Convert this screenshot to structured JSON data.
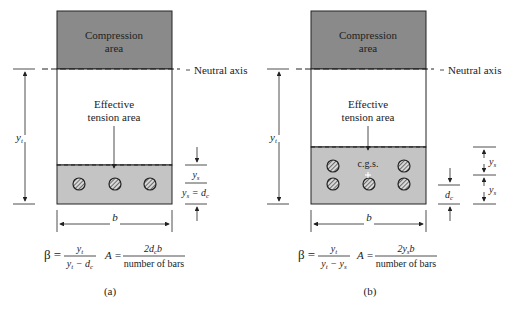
{
  "colors": {
    "compression_fill": "#8a8a8a",
    "tension_fill": "#c4c4c4",
    "line": "#222222",
    "background": "#ffffff"
  },
  "panel_a": {
    "caption": "(a)",
    "compression_label_line1": "Compression",
    "compression_label_line2": "area",
    "neutral_axis_label": "Neutral axis",
    "effective_label_line1": "Effective",
    "effective_label_line2": "tension area",
    "dim_yt": "y",
    "dim_yt_sub": "t",
    "dim_b": "b",
    "dim_ys_top": "y",
    "dim_ys_top_sub": "s",
    "dim_ys_bottom": "y",
    "dim_ys_bottom_sub": "s",
    "dim_ys_eq": " = d",
    "dim_ys_eq_sub": "c",
    "bars": 3,
    "formula_beta_lhs": "β =",
    "formula_beta_num": "y",
    "formula_beta_num_sub": "t",
    "formula_beta_den": "y",
    "formula_beta_den_sub": "t",
    "formula_beta_den_rest": " − d",
    "formula_beta_den_rest_sub": "c",
    "formula_A_lhs": "A =",
    "formula_A_num_pre": "2d",
    "formula_A_num_sub": "c",
    "formula_A_num_post": "b",
    "formula_A_den": "number of bars"
  },
  "panel_b": {
    "caption": "(b)",
    "compression_label_line1": "Compression",
    "compression_label_line2": "area",
    "neutral_axis_label": "Neutral axis",
    "effective_label_line1": "Effective",
    "effective_label_line2": "tension area",
    "cgs_label": "c.g.s.",
    "dim_yt": "y",
    "dim_yt_sub": "t",
    "dim_b": "b",
    "dim_dc": "d",
    "dim_dc_sub": "c",
    "dim_ys1": "y",
    "dim_ys1_sub": "s",
    "dim_ys2": "y",
    "dim_ys2_sub": "s",
    "bars": 6,
    "formula_beta_lhs": "β =",
    "formula_beta_num": "y",
    "formula_beta_num_sub": "t",
    "formula_beta_den": "y",
    "formula_beta_den_sub": "t",
    "formula_beta_den_rest": " − y",
    "formula_beta_den_rest_sub": "s",
    "formula_A_lhs": "A =",
    "formula_A_num_pre": "2y",
    "formula_A_num_sub": "s",
    "formula_A_num_post": "b",
    "formula_A_den": "number of bars"
  }
}
